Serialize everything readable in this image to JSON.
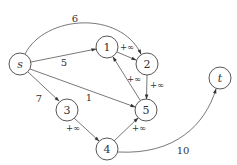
{
  "diagram": {
    "type": "flow-network",
    "nodes": [
      {
        "id": "s",
        "label": "s",
        "x": 20,
        "y": 64,
        "italic": true
      },
      {
        "id": "1",
        "label": "1",
        "x": 107,
        "y": 47,
        "italic": false
      },
      {
        "id": "2",
        "label": "2",
        "x": 147,
        "y": 64,
        "italic": false
      },
      {
        "id": "3",
        "label": "3",
        "x": 67,
        "y": 110,
        "italic": false
      },
      {
        "id": "4",
        "label": "4",
        "x": 107,
        "y": 149,
        "italic": false
      },
      {
        "id": "5",
        "label": "5",
        "x": 146,
        "y": 110,
        "italic": false
      },
      {
        "id": "t",
        "label": "t",
        "x": 220,
        "y": 78,
        "italic": true
      }
    ],
    "edges": [
      {
        "from": "s",
        "to": "2",
        "label": "6",
        "curved": true
      },
      {
        "from": "s",
        "to": "1",
        "label": "5"
      },
      {
        "from": "s",
        "to": "5",
        "label": "1"
      },
      {
        "from": "s",
        "to": "3",
        "label": "7"
      },
      {
        "from": "1",
        "to": "2",
        "label": "+∞"
      },
      {
        "from": "2",
        "to": "5",
        "label": "+∞"
      },
      {
        "from": "5",
        "to": "1",
        "label": "+∞"
      },
      {
        "from": "3",
        "to": "4",
        "label": "+∞"
      },
      {
        "from": "4",
        "to": "5",
        "label": "+∞"
      },
      {
        "from": "4",
        "to": "t",
        "label": "10",
        "curved": true
      }
    ]
  },
  "labels": {
    "node_s": "s",
    "node_1": "1",
    "node_2": "2",
    "node_3": "3",
    "node_4": "4",
    "node_5": "5",
    "node_t": "t",
    "edge_s_2": "6",
    "edge_s_1": "5",
    "edge_s_5": "1",
    "edge_s_3": "7",
    "edge_1_2": "+∞",
    "edge_2_5": "+∞",
    "edge_5_1": "+∞",
    "edge_3_4": "+∞",
    "edge_4_5": "+∞",
    "edge_4_t": "10"
  }
}
